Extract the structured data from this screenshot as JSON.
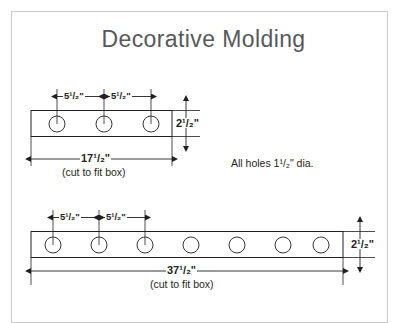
{
  "document": {
    "title": "Decorative Molding",
    "type": "technical-drawing",
    "background_color": "#ffffff",
    "border_color": "#c9c9cc",
    "line_color": "#231f20",
    "title_color": "#58585b"
  },
  "notes": {
    "hole_diameter_note": "All holes 1¹/₂\" dia."
  },
  "parts": [
    {
      "id": "short-molding",
      "name": "Short decorative molding",
      "overall_length_label": "17¹/₂\"",
      "overall_length_value": 17.5,
      "cut_note": "(cut to fit box)",
      "height_label": "2¹/₂\"",
      "height_value": 2.5,
      "hole_count": 7,
      "holes_visible": 3,
      "hole_spacing_labels": [
        "5¹/₂\"",
        "5¹/₂\""
      ],
      "hole_spacing_value": 5.5,
      "hole_diameter": 1.5
    },
    {
      "id": "long-molding",
      "name": "Long decorative molding",
      "overall_length_label": "37¹/₂\"",
      "overall_length_value": 37.5,
      "cut_note": "(cut to fit box)",
      "height_label": "2¹/₂\"",
      "height_value": 2.5,
      "hole_count": 7,
      "holes_visible": 7,
      "hole_spacing_labels": [
        "5¹/₂\"",
        "5¹/₂\""
      ],
      "hole_spacing_value": 5.5,
      "hole_diameter": 1.5
    }
  ],
  "labels": {
    "part1_spacing_1": "5¹/₂\"",
    "part1_spacing_2": "5¹/₂\"",
    "part1_height": "2¹/₂\"",
    "part1_length": "17¹/₂\"",
    "part1_cut_note": "(cut to fit box)",
    "part2_spacing_1": "5¹/₂\"",
    "part2_spacing_2": "5¹/₂\"",
    "part2_height": "2¹/₂\"",
    "part2_length": "37¹/₂\"",
    "part2_cut_note": "(cut to fit box)",
    "hole_note": "All holes 1¹/₂\" dia."
  }
}
